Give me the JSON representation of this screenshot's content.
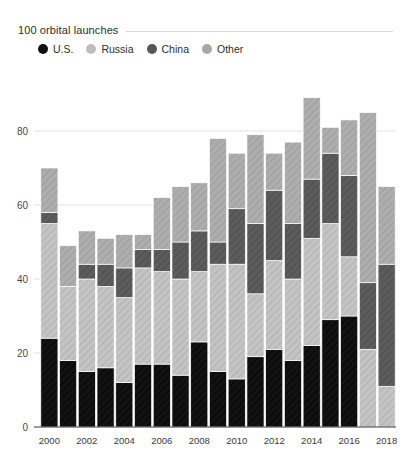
{
  "chart_data": {
    "type": "bar",
    "stacked": true,
    "title": "100 orbital launches",
    "xlabel": "",
    "ylabel": "",
    "ylim": [
      0,
      100
    ],
    "yticks": [
      0,
      20,
      40,
      60,
      80
    ],
    "grid": true,
    "legend_position": "top-left",
    "categories": [
      "2000",
      "2001",
      "2002",
      "2003",
      "2004",
      "2005",
      "2006",
      "2007",
      "2008",
      "2009",
      "2010",
      "2011",
      "2012",
      "2013",
      "2014",
      "2015",
      "2016",
      "2017",
      "2018"
    ],
    "tick_labels": [
      "2000",
      "",
      "2002",
      "",
      "2004",
      "",
      "2006",
      "",
      "2008",
      "",
      "2010",
      "",
      "2012",
      "",
      "2014",
      "",
      "2016",
      "",
      "2018"
    ],
    "series": [
      {
        "name": "U.S.",
        "color": "#111111",
        "values": [
          24,
          18,
          15,
          16,
          12,
          17,
          17,
          14,
          23,
          15,
          13,
          19,
          21,
          18,
          22,
          29,
          30,
          0,
          0
        ]
      },
      {
        "name": "Russia",
        "color": "#bdbdbd",
        "values": [
          31,
          20,
          25,
          22,
          23,
          26,
          25,
          26,
          19,
          29,
          31,
          17,
          24,
          22,
          29,
          26,
          16,
          21,
          11
        ]
      },
      {
        "name": "China",
        "color": "#565656",
        "values": [
          3,
          0,
          4,
          6,
          8,
          5,
          6,
          10,
          11,
          6,
          15,
          19,
          19,
          15,
          16,
          19,
          22,
          18,
          33
        ]
      },
      {
        "name": "Other",
        "color": "#a8a8a8",
        "values": [
          12,
          11,
          9,
          7,
          9,
          4,
          14,
          15,
          13,
          28,
          15,
          24,
          10,
          22,
          22,
          7,
          15,
          46,
          21
        ]
      }
    ],
    "totals": [
      70,
      49,
      53,
      51,
      52,
      52,
      62,
      65,
      66,
      78,
      74,
      79,
      74,
      77,
      89,
      81,
      83,
      85,
      95
    ]
  },
  "legend": {
    "items": [
      {
        "label": "U.S.",
        "color": "#111111",
        "hatched": false
      },
      {
        "label": "Russia",
        "color": "#bdbdbd",
        "hatched": true
      },
      {
        "label": "China",
        "color": "#565656",
        "hatched": true
      },
      {
        "label": "Other",
        "color": "#a8a8a8",
        "hatched": true
      }
    ]
  }
}
